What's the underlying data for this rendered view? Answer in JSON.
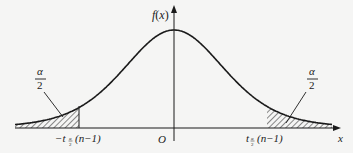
{
  "chart_data": {
    "type": "area",
    "title": "",
    "xlabel": "x",
    "ylabel": "f(x)",
    "origin_label": "O",
    "grid": false,
    "legend": null,
    "curve": "symmetric bell-shaped density centered at O",
    "shaded_regions": [
      {
        "side": "left",
        "range": "x < -t_{α/2}(n-1)",
        "area_label": "α/2"
      },
      {
        "side": "right",
        "range": "x > t_{α/2}(n-1)",
        "area_label": "α/2"
      }
    ],
    "tick_labels": [
      "-t_{α/2}(n-1)",
      "O",
      "t_{α/2}(n-1)"
    ]
  },
  "labels": {
    "y_axis": "f(x)",
    "x_axis": "x",
    "origin": "O",
    "left_area_num": "α",
    "left_area_den": "2",
    "right_area_num": "α",
    "right_area_den": "2",
    "left_tick_minus": "−t",
    "left_tick_sub_num": "α",
    "left_tick_sub_den": "2",
    "left_tick_arg": "(n−1)",
    "right_tick_t": "t",
    "right_tick_sub_num": "α",
    "right_tick_sub_den": "2",
    "right_tick_arg": "(n−1)"
  },
  "colors": {
    "ink": "#1a1a1a",
    "background": "#f5f5f4"
  }
}
